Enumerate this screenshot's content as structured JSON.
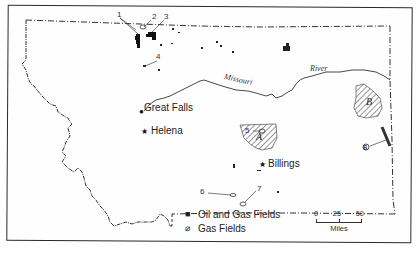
{
  "map": {
    "region": "Montana",
    "cities": [
      {
        "name": "Great Falls",
        "type": "city"
      },
      {
        "name": "Helena",
        "type": "capital"
      },
      {
        "name": "Billings",
        "type": "city"
      }
    ],
    "river": {
      "name_part1": "Missouri",
      "name_part2": "River"
    },
    "field_numbers": [
      "1",
      "2",
      "3",
      "4",
      "5",
      "6",
      "6",
      "7"
    ],
    "hatched_areas": [
      "A",
      "B"
    ]
  },
  "legend": {
    "items": [
      {
        "symbol": "oil-gas-field-icon",
        "glyph": "■",
        "label": "Oil and Gas Fields"
      },
      {
        "symbol": "gas-field-icon",
        "glyph": "⌀",
        "label": "Gas Fields"
      }
    ]
  },
  "scale": {
    "ticks": [
      "0",
      "25",
      "50"
    ],
    "unit": "Miles"
  },
  "colors": {
    "ink": "#222222",
    "paper": "#ffffff"
  }
}
